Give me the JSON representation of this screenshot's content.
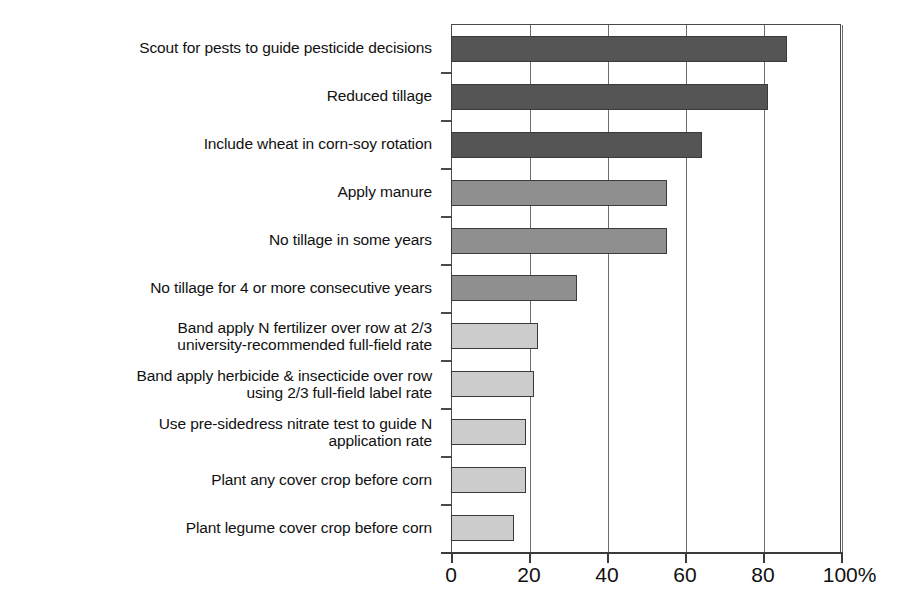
{
  "chart_data": {
    "type": "bar",
    "orientation": "horizontal",
    "title": "",
    "subtitle": "",
    "xlabel": "",
    "ylabel": "",
    "xlim": [
      0,
      100
    ],
    "ylim": null,
    "grid": true,
    "legend": null,
    "axis_unit": "%",
    "xticks": [
      0,
      20,
      40,
      60,
      80,
      100
    ],
    "xtick_labels": [
      "0",
      "20",
      "40",
      "60",
      "80",
      "100%"
    ],
    "categories": [
      "Scout for pests to guide pesticide decisions",
      "Reduced tillage",
      "Include wheat in corn-soy rotation",
      "Apply manure",
      "No tillage in some years",
      "No tillage for 4 or more consecutive years",
      "Band apply N fertilizer over row at 2/3\nuniversity-recommended full-field rate",
      "Band apply herbicide & insecticide over row\nusing 2/3 full-field label rate",
      "Use pre-sidedress nitrate test to guide N\napplication rate",
      "Plant any cover crop before corn",
      "Plant legume cover crop before corn"
    ],
    "values": [
      86,
      81,
      64,
      55,
      55,
      32,
      22,
      21,
      19,
      19,
      16
    ],
    "bar_colors": [
      "#555555",
      "#555555",
      "#555555",
      "#8f8f8f",
      "#8f8f8f",
      "#8f8f8f",
      "#cccccc",
      "#cccccc",
      "#cccccc",
      "#cccccc",
      "#cccccc"
    ],
    "bar_border_color": "#3a3a3a",
    "axis_color": "#3a3a3a",
    "gridline_color": "#6d6d6d",
    "background": "#ffffff"
  }
}
